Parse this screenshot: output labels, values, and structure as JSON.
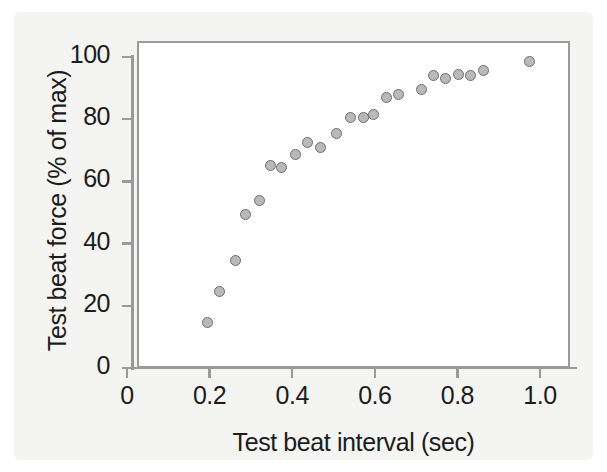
{
  "chart_data": {
    "type": "scatter",
    "title": "",
    "xlabel": "Test beat interval (sec)",
    "ylabel": "Test beat force (% of max)",
    "xlim": [
      0,
      1.08
    ],
    "ylim": [
      0,
      107
    ],
    "grid": false,
    "legend": "none",
    "marker": {
      "shape": "circle",
      "fill_color": "#b9b9b9",
      "edge_color": "#6e6e6e",
      "size_px": 11
    },
    "axis_color": "#9a9a9a",
    "xticks": [
      0,
      0.2,
      0.4,
      0.6,
      0.8,
      1.0
    ],
    "xtick_labels": [
      "0",
      "0.2",
      "0.4",
      "0.6",
      "0.8",
      "1.0"
    ],
    "yticks": [
      0,
      20,
      40,
      60,
      80,
      100
    ],
    "ytick_labels": [
      "0",
      "20",
      "40",
      "60",
      "80",
      "100"
    ],
    "series": [
      {
        "name": "Test beat force",
        "points": [
          {
            "x": 0.195,
            "y": 14.5
          },
          {
            "x": 0.225,
            "y": 24.5
          },
          {
            "x": 0.262,
            "y": 34.5
          },
          {
            "x": 0.288,
            "y": 49.5
          },
          {
            "x": 0.32,
            "y": 54.0
          },
          {
            "x": 0.348,
            "y": 65.0
          },
          {
            "x": 0.375,
            "y": 64.5
          },
          {
            "x": 0.408,
            "y": 68.5
          },
          {
            "x": 0.438,
            "y": 72.5
          },
          {
            "x": 0.468,
            "y": 71.0
          },
          {
            "x": 0.508,
            "y": 75.5
          },
          {
            "x": 0.54,
            "y": 80.5
          },
          {
            "x": 0.572,
            "y": 80.5
          },
          {
            "x": 0.598,
            "y": 81.5
          },
          {
            "x": 0.628,
            "y": 87.0
          },
          {
            "x": 0.658,
            "y": 88.0
          },
          {
            "x": 0.712,
            "y": 89.5
          },
          {
            "x": 0.742,
            "y": 94.0
          },
          {
            "x": 0.772,
            "y": 93.0
          },
          {
            "x": 0.802,
            "y": 94.5
          },
          {
            "x": 0.832,
            "y": 94.0
          },
          {
            "x": 0.862,
            "y": 95.5
          },
          {
            "x": 0.975,
            "y": 98.5
          }
        ]
      }
    ]
  }
}
